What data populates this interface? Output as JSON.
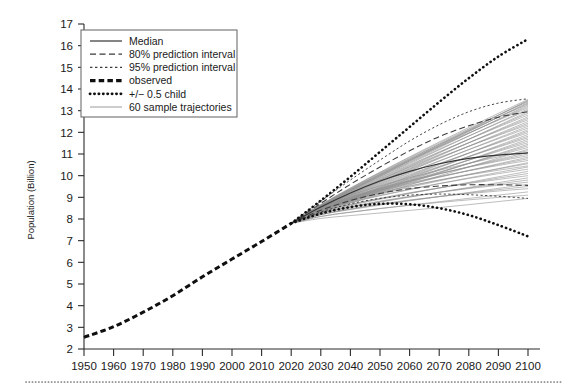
{
  "chart_data": {
    "type": "line",
    "title": "",
    "xlabel": "",
    "ylabel": "Population (Billion)",
    "xlim": [
      1950,
      2100
    ],
    "ylim": [
      2,
      17
    ],
    "grid": false,
    "legend_position": "top-left",
    "x_ticks": [
      1950,
      1960,
      1970,
      1980,
      1990,
      2000,
      2010,
      2020,
      2030,
      2040,
      2050,
      2060,
      2070,
      2080,
      2090,
      2100
    ],
    "y_ticks": [
      2,
      3,
      4,
      5,
      6,
      7,
      8,
      9,
      10,
      11,
      12,
      13,
      14,
      15,
      16,
      17
    ],
    "legend": [
      {
        "key": "median",
        "label": "Median",
        "style": "solid-thin"
      },
      {
        "key": "pi80",
        "label": "80% prediction interval",
        "style": "dashed"
      },
      {
        "key": "pi95",
        "label": "95% prediction interval",
        "style": "fine-dashed"
      },
      {
        "key": "observed",
        "label": "observed",
        "style": "thick-dashed"
      },
      {
        "key": "halfchild",
        "label": "+/− 0.5 child",
        "style": "dotted"
      },
      {
        "key": "trajectories",
        "label": "60 sample trajectories",
        "style": "solid-grey"
      }
    ],
    "series": [
      {
        "name": "observed",
        "x": [
          1950,
          1960,
          1970,
          1980,
          1990,
          2000,
          2010,
          2020
        ],
        "values": [
          2.54,
          3.03,
          3.7,
          4.46,
          5.33,
          6.15,
          6.96,
          7.8
        ]
      },
      {
        "name": "Median",
        "x": [
          2020,
          2030,
          2040,
          2050,
          2060,
          2070,
          2080,
          2090,
          2100
        ],
        "values": [
          7.8,
          8.55,
          9.2,
          9.75,
          10.2,
          10.55,
          10.8,
          10.95,
          11.05
        ]
      },
      {
        "name": "80% prediction interval upper",
        "x": [
          2020,
          2030,
          2040,
          2050,
          2060,
          2070,
          2080,
          2090,
          2100
        ],
        "values": [
          7.8,
          8.72,
          9.6,
          10.4,
          11.15,
          11.8,
          12.3,
          12.7,
          12.95
        ]
      },
      {
        "name": "80% prediction interval lower",
        "x": [
          2020,
          2030,
          2040,
          2050,
          2060,
          2070,
          2080,
          2090,
          2100
        ],
        "values": [
          7.8,
          8.4,
          8.85,
          9.18,
          9.4,
          9.52,
          9.58,
          9.58,
          9.55
        ]
      },
      {
        "name": "95% prediction interval upper",
        "x": [
          2020,
          2030,
          2040,
          2050,
          2060,
          2070,
          2080,
          2090,
          2100
        ],
        "values": [
          7.8,
          8.82,
          9.8,
          10.72,
          11.6,
          12.35,
          12.95,
          13.35,
          13.55
        ]
      },
      {
        "name": "95% prediction interval lower",
        "x": [
          2020,
          2030,
          2040,
          2050,
          2060,
          2070,
          2080,
          2090,
          2100
        ],
        "values": [
          7.8,
          8.32,
          8.7,
          8.95,
          9.1,
          9.15,
          9.12,
          9.05,
          8.95
        ]
      },
      {
        "name": "+/- 0.5 child high",
        "x": [
          2020,
          2030,
          2040,
          2050,
          2060,
          2070,
          2080,
          2090,
          2100
        ],
        "values": [
          7.8,
          8.85,
          9.95,
          11.1,
          12.25,
          13.4,
          14.5,
          15.5,
          16.3
        ]
      },
      {
        "name": "+/- 0.5 child low",
        "x": [
          2020,
          2030,
          2040,
          2050,
          2060,
          2070,
          2080,
          2090,
          2100
        ],
        "values": [
          7.8,
          8.25,
          8.55,
          8.7,
          8.68,
          8.5,
          8.18,
          7.72,
          7.2
        ]
      }
    ],
    "trajectory_count": 60,
    "trajectory_endpoints_2100": [
      8.95,
      9.1,
      9.25,
      9.4,
      9.5,
      9.6,
      9.7,
      9.8,
      9.9,
      10.0,
      10.1,
      10.2,
      10.3,
      10.4,
      10.45,
      10.55,
      10.6,
      10.7,
      10.78,
      10.85,
      10.92,
      11.0,
      11.08,
      11.15,
      11.22,
      11.3,
      11.38,
      11.45,
      11.52,
      11.6,
      11.68,
      11.75,
      11.82,
      11.9,
      11.98,
      12.05,
      12.12,
      12.2,
      12.28,
      12.35,
      12.42,
      12.5,
      12.58,
      12.65,
      12.72,
      12.8,
      12.88,
      12.95,
      13.02,
      13.08,
      13.14,
      13.2,
      13.26,
      13.3,
      13.34,
      13.38,
      13.42,
      13.45,
      13.48,
      13.52
    ]
  },
  "colors": {
    "axis": "#2b2b2b",
    "trajectory": "#8e8e8e",
    "median": "#333333",
    "observed": "#0f0f0f",
    "legend_border": "#6e6e6e",
    "footer_rule": "#7a7a7a"
  }
}
